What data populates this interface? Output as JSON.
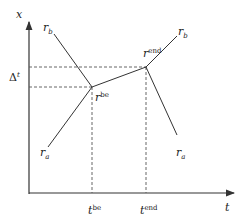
{
  "diagram": {
    "axes": {
      "y_label": "x",
      "x_label": "t"
    },
    "labels": {
      "delta": {
        "base": "Δ",
        "sup": "t"
      },
      "r_b_left": {
        "base": "r",
        "sub": "b"
      },
      "r_a_left": {
        "base": "r",
        "sub": "a"
      },
      "r_b_right": {
        "base": "r",
        "sub": "b"
      },
      "r_a_right": {
        "base": "r",
        "sub": "a"
      },
      "r_be": {
        "base": "r",
        "sup": "be"
      },
      "r_end": {
        "base": "r",
        "sup": "end"
      },
      "t_be": {
        "base": "t",
        "sup": "be"
      },
      "t_end": {
        "base": "t",
        "sup": "end"
      }
    },
    "colors": {
      "line": "#333333",
      "dashed": "#555555"
    }
  }
}
